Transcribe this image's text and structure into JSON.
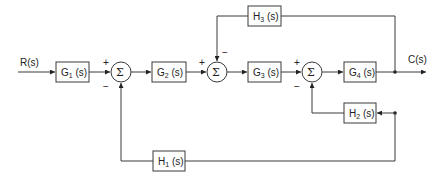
{
  "signals": {
    "input": "R(s)",
    "output": "C(s)"
  },
  "blocks": {
    "g1": {
      "name": "G",
      "sub": "1",
      "arg": " (s)"
    },
    "g2": {
      "name": "G",
      "sub": "2",
      "arg": " (s)"
    },
    "g3": {
      "name": "G",
      "sub": "3",
      "arg": " (s)"
    },
    "g4": {
      "name": "G",
      "sub": "4",
      "arg": " (s)"
    },
    "h1": {
      "name": "H",
      "sub": "1",
      "arg": " (s)"
    },
    "h2": {
      "name": "H",
      "sub": "2",
      "arg": " (s)"
    },
    "h3": {
      "name": "H",
      "sub": "3",
      "arg": " (s)"
    }
  },
  "summers": {
    "symbol": "Σ",
    "plus": "+",
    "minus": "−"
  },
  "colors": {
    "line": "#3a3a3a",
    "background": "#ffffff"
  }
}
